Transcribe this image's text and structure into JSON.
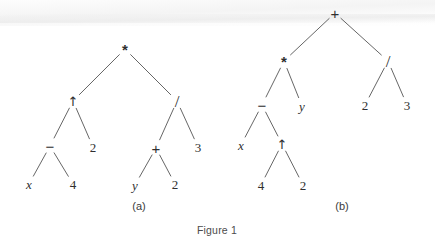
{
  "figure": {
    "caption": "Figure 1",
    "background_color": "#ffffff",
    "ink_color": "#2f2f2f",
    "edge_color": "#4a4a4a"
  },
  "subfigures": [
    {
      "id": "a",
      "label": "(a)",
      "label_pos": {
        "x": 139,
        "y": 206
      },
      "expression": "(x - 4) ^ 2 * ((y + 2) / 3)",
      "nodes": [
        {
          "id": "a-root",
          "text": "*",
          "kind": "op-times",
          "x": 125,
          "y": 49
        },
        {
          "id": "a-n1",
          "text": "↑",
          "kind": "op-arrow",
          "x": 73,
          "y": 101
        },
        {
          "id": "a-n2",
          "text": "/",
          "kind": "op-div",
          "x": 177,
          "y": 101
        },
        {
          "id": "a-n3",
          "text": "−",
          "kind": "op-minus",
          "x": 50,
          "y": 146
        },
        {
          "id": "a-n4",
          "text": "2",
          "kind": "num",
          "x": 93,
          "y": 147
        },
        {
          "id": "a-n5",
          "text": "+",
          "kind": "op-plus",
          "x": 156,
          "y": 148
        },
        {
          "id": "a-n6",
          "text": "3",
          "kind": "num",
          "x": 198,
          "y": 147
        },
        {
          "id": "a-n7",
          "text": "x",
          "kind": "var",
          "x": 29,
          "y": 184
        },
        {
          "id": "a-n8",
          "text": "4",
          "kind": "num",
          "x": 73,
          "y": 184
        },
        {
          "id": "a-n9",
          "text": "y",
          "kind": "var",
          "x": 135,
          "y": 185
        },
        {
          "id": "a-n10",
          "text": "2",
          "kind": "num",
          "x": 175,
          "y": 184
        }
      ],
      "edges": [
        {
          "from": "a-root",
          "to": "a-n1"
        },
        {
          "from": "a-root",
          "to": "a-n2"
        },
        {
          "from": "a-n1",
          "to": "a-n3"
        },
        {
          "from": "a-n1",
          "to": "a-n4"
        },
        {
          "from": "a-n2",
          "to": "a-n5"
        },
        {
          "from": "a-n2",
          "to": "a-n6"
        },
        {
          "from": "a-n3",
          "to": "a-n7"
        },
        {
          "from": "a-n3",
          "to": "a-n8"
        },
        {
          "from": "a-n5",
          "to": "a-n9"
        },
        {
          "from": "a-n5",
          "to": "a-n10"
        }
      ]
    },
    {
      "id": "b",
      "label": "(b)",
      "label_pos": {
        "x": 342,
        "y": 206
      },
      "expression": "(x - 4 ^ 2) * y + 2 / 3",
      "nodes": [
        {
          "id": "b-root",
          "text": "+",
          "kind": "op-plus",
          "x": 335,
          "y": 13
        },
        {
          "id": "b-n1",
          "text": "*",
          "kind": "op-times",
          "x": 284,
          "y": 61
        },
        {
          "id": "b-n2",
          "text": "/",
          "kind": "op-div",
          "x": 388,
          "y": 61
        },
        {
          "id": "b-n3",
          "text": "−",
          "kind": "op-minus",
          "x": 262,
          "y": 105
        },
        {
          "id": "b-n4",
          "text": "y",
          "kind": "var",
          "x": 302,
          "y": 106
        },
        {
          "id": "b-n5",
          "text": "2",
          "kind": "num",
          "x": 365,
          "y": 105
        },
        {
          "id": "b-n6",
          "text": "3",
          "kind": "num",
          "x": 407,
          "y": 105
        },
        {
          "id": "b-n7",
          "text": "x",
          "kind": "var",
          "x": 241,
          "y": 145
        },
        {
          "id": "b-n8",
          "text": "↑",
          "kind": "op-arrow",
          "x": 282,
          "y": 144
        },
        {
          "id": "b-n9",
          "text": "4",
          "kind": "num",
          "x": 261,
          "y": 185
        },
        {
          "id": "b-n10",
          "text": "2",
          "kind": "num",
          "x": 303,
          "y": 185
        }
      ],
      "edges": [
        {
          "from": "b-root",
          "to": "b-n1"
        },
        {
          "from": "b-root",
          "to": "b-n2"
        },
        {
          "from": "b-n1",
          "to": "b-n3"
        },
        {
          "from": "b-n1",
          "to": "b-n4"
        },
        {
          "from": "b-n2",
          "to": "b-n5"
        },
        {
          "from": "b-n2",
          "to": "b-n6"
        },
        {
          "from": "b-n3",
          "to": "b-n7"
        },
        {
          "from": "b-n3",
          "to": "b-n8"
        },
        {
          "from": "b-n8",
          "to": "b-n9"
        },
        {
          "from": "b-n8",
          "to": "b-n10"
        }
      ]
    }
  ],
  "caption_pos": {
    "x": 217,
    "y": 230
  }
}
